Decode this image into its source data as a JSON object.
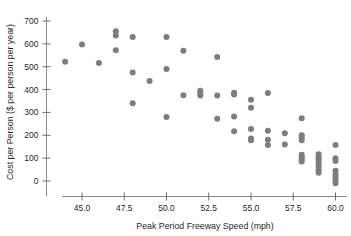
{
  "chart_data": {
    "type": "scatter",
    "title": "",
    "xlabel": "Peak Period Freeway Speed (mph)",
    "ylabel": "Cost per Person ($ per person per year)",
    "xlim": [
      43.2,
      61.0
    ],
    "ylim": [
      -40,
      720
    ],
    "xticks": [
      45.0,
      47.5,
      50.0,
      52.5,
      55.0,
      57.5,
      60.0
    ],
    "xtick_labels": [
      "45.0",
      "47.5",
      "50.0",
      "52.5",
      "55.0",
      "57.5",
      "60.0"
    ],
    "yticks": [
      0,
      100,
      200,
      300,
      400,
      500,
      600,
      700
    ],
    "ytick_labels": [
      "0",
      "100",
      "200",
      "300",
      "400",
      "500",
      "600",
      "700"
    ],
    "grid": false,
    "legend": "none",
    "marker": {
      "shape": "circle",
      "color": "#7d7d7d",
      "size": 3.0
    },
    "points": [
      {
        "x": 44.0,
        "y": 522
      },
      {
        "x": 45.0,
        "y": 597
      },
      {
        "x": 46.0,
        "y": 516
      },
      {
        "x": 47.0,
        "y": 655
      },
      {
        "x": 47.0,
        "y": 637
      },
      {
        "x": 47.0,
        "y": 572
      },
      {
        "x": 48.0,
        "y": 630
      },
      {
        "x": 48.0,
        "y": 475
      },
      {
        "x": 48.0,
        "y": 340
      },
      {
        "x": 49.0,
        "y": 438
      },
      {
        "x": 50.0,
        "y": 630
      },
      {
        "x": 50.0,
        "y": 490
      },
      {
        "x": 50.0,
        "y": 280
      },
      {
        "x": 51.0,
        "y": 570
      },
      {
        "x": 51.0,
        "y": 375
      },
      {
        "x": 52.0,
        "y": 395
      },
      {
        "x": 52.0,
        "y": 385
      },
      {
        "x": 52.0,
        "y": 374
      },
      {
        "x": 53.0,
        "y": 542
      },
      {
        "x": 53.0,
        "y": 374
      },
      {
        "x": 53.0,
        "y": 272
      },
      {
        "x": 54.0,
        "y": 386
      },
      {
        "x": 54.0,
        "y": 378
      },
      {
        "x": 54.0,
        "y": 282
      },
      {
        "x": 54.0,
        "y": 218
      },
      {
        "x": 55.0,
        "y": 355
      },
      {
        "x": 55.0,
        "y": 320
      },
      {
        "x": 55.0,
        "y": 228
      },
      {
        "x": 55.0,
        "y": 186
      },
      {
        "x": 55.0,
        "y": 178
      },
      {
        "x": 56.0,
        "y": 385
      },
      {
        "x": 56.0,
        "y": 220
      },
      {
        "x": 56.0,
        "y": 180
      },
      {
        "x": 56.0,
        "y": 158
      },
      {
        "x": 57.0,
        "y": 209
      },
      {
        "x": 57.0,
        "y": 160
      },
      {
        "x": 58.0,
        "y": 275
      },
      {
        "x": 58.0,
        "y": 200
      },
      {
        "x": 58.0,
        "y": 190
      },
      {
        "x": 58.0,
        "y": 178
      },
      {
        "x": 58.0,
        "y": 115
      },
      {
        "x": 58.0,
        "y": 104
      },
      {
        "x": 58.0,
        "y": 94
      },
      {
        "x": 58.0,
        "y": 85
      },
      {
        "x": 59.0,
        "y": 117
      },
      {
        "x": 59.0,
        "y": 106
      },
      {
        "x": 59.0,
        "y": 95
      },
      {
        "x": 59.0,
        "y": 84
      },
      {
        "x": 59.0,
        "y": 72
      },
      {
        "x": 59.0,
        "y": 60
      },
      {
        "x": 59.0,
        "y": 48
      },
      {
        "x": 59.0,
        "y": 36
      },
      {
        "x": 60.0,
        "y": 157
      },
      {
        "x": 60.0,
        "y": 100
      },
      {
        "x": 60.0,
        "y": 88
      },
      {
        "x": 60.0,
        "y": 45
      },
      {
        "x": 60.0,
        "y": 30
      },
      {
        "x": 60.0,
        "y": 14
      },
      {
        "x": 60.0,
        "y": 2
      },
      {
        "x": 60.0,
        "y": -10
      }
    ]
  }
}
